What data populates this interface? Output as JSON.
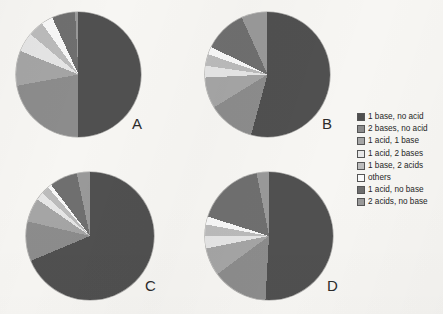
{
  "figure": {
    "background_color": "#f7f6f3",
    "label_color": "#2b2b2b"
  },
  "legend": {
    "position": "right",
    "entries": [
      {
        "label": "1 base, no acid",
        "color": "#4f4f4f"
      },
      {
        "label": "2 bases, no acid",
        "color": "#8c8c8c"
      },
      {
        "label": "1 acid, 1 base",
        "color": "#a6a6a6"
      },
      {
        "label": "1 acid, 2 bases",
        "color": "#e8e8e8"
      },
      {
        "label": "1 base, 2 acids",
        "color": "#bdbdbd"
      },
      {
        "label": "others",
        "color": "#fbfbfb"
      },
      {
        "label": "1 acid, no base",
        "color": "#6e6e6e"
      },
      {
        "label": "2 acids, no base",
        "color": "#9a9a9a"
      }
    ]
  },
  "chart_data": {
    "type": "pie",
    "title": "",
    "categories": [
      "1 base, no acid",
      "2 bases, no acid",
      "1 acid, 1 base",
      "1 acid, 2 bases",
      "1 base, 2 acids",
      "others",
      "1 acid, no base",
      "2 acids, no base"
    ],
    "colors": [
      "#4f4f4f",
      "#8c8c8c",
      "#a6a6a6",
      "#e8e8e8",
      "#bdbdbd",
      "#fbfbfb",
      "#6e6e6e",
      "#9a9a9a"
    ],
    "units": "percent",
    "charts": [
      {
        "label": "A",
        "values": [
          44,
          22,
          9,
          5,
          4,
          3,
          6,
          7
        ]
      },
      {
        "label": "B",
        "values": [
          52,
          12,
          8,
          3,
          3,
          2,
          11,
          9
        ]
      },
      {
        "label": "C",
        "values": [
          67,
          10,
          6,
          2,
          2,
          1,
          7,
          5
        ]
      },
      {
        "label": "D",
        "values": [
          47,
          14,
          7,
          3,
          3,
          2,
          17,
          7
        ]
      }
    ]
  }
}
